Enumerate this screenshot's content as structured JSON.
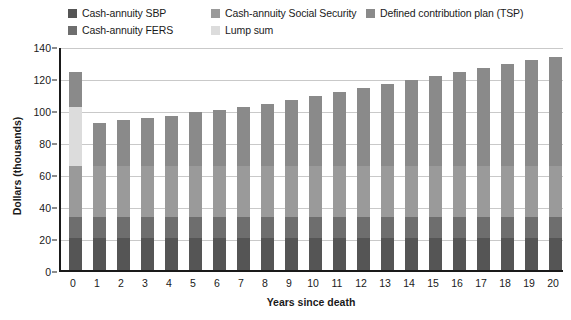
{
  "chart_data": {
    "type": "bar",
    "subtype": "stacked-column",
    "title": "",
    "xlabel": "Years since death",
    "ylabel": "Dollars (thousands)",
    "ylim": [
      0,
      140
    ],
    "ytick_step": 20,
    "yticks": [
      0,
      20,
      40,
      60,
      80,
      100,
      120,
      140
    ],
    "grid": true,
    "grid_axis": "y",
    "legend_position": "top",
    "categories": [
      "0",
      "1",
      "2",
      "3",
      "4",
      "5",
      "6",
      "7",
      "8",
      "9",
      "10",
      "11",
      "12",
      "13",
      "14",
      "15",
      "16",
      "17",
      "18",
      "19",
      "20"
    ],
    "x": [
      0,
      1,
      2,
      3,
      4,
      5,
      6,
      7,
      8,
      9,
      10,
      11,
      12,
      13,
      14,
      15,
      16,
      17,
      18,
      19,
      20
    ],
    "series": [
      {
        "name": "Cash-annuity SBP",
        "color": "#555555",
        "values": [
          20,
          20,
          20,
          20,
          20,
          20,
          20,
          20,
          20,
          20,
          20,
          20,
          20,
          20,
          20,
          20,
          20,
          20,
          20,
          20,
          20
        ]
      },
      {
        "name": "Cash-annuity FERS",
        "color": "#6e6e6e",
        "values": [
          13,
          13,
          13,
          13,
          13,
          13,
          13,
          13,
          13,
          13,
          13,
          13,
          13,
          13,
          13,
          13,
          13,
          13,
          13,
          13,
          13
        ]
      },
      {
        "name": "Cash-annuity Social Security",
        "color": "#9a9a9a",
        "values": [
          32,
          32,
          32,
          32,
          32,
          32,
          32,
          32,
          32,
          32,
          32,
          32,
          32,
          32,
          32,
          32,
          32,
          32,
          32,
          32,
          32
        ]
      },
      {
        "name": "Lump sum",
        "color": "#dcdcdc",
        "values": [
          37,
          0,
          0,
          0,
          0,
          0,
          0,
          0,
          0,
          0,
          0,
          0,
          0,
          0,
          0,
          0,
          0,
          0,
          0,
          0,
          0
        ]
      },
      {
        "name": "Defined contribution plan (TSP)",
        "color": "#8a8a8a",
        "values": [
          22,
          27,
          28.5,
          30,
          31.5,
          33.5,
          35,
          37,
          39,
          41.5,
          43.5,
          46,
          48.5,
          51.5,
          53.5,
          56,
          58.5,
          61,
          63.5,
          66,
          68
        ]
      }
    ],
    "totals": [
      124,
      92,
      93.5,
      95,
      96.5,
      98.5,
      100,
      102,
      104,
      106.5,
      108.5,
      111,
      113.5,
      116.5,
      118.5,
      121,
      123.5,
      126,
      128.5,
      131,
      133
    ]
  },
  "legend": {
    "columns": [
      {
        "items": [
          {
            "label": "Cash-annuity SBP",
            "color": "#555555"
          },
          {
            "label": "Cash-annuity FERS",
            "color": "#6e6e6e"
          }
        ]
      },
      {
        "items": [
          {
            "label": "Cash-annuity Social Security",
            "color": "#9a9a9a"
          },
          {
            "label": "Lump sum",
            "color": "#dcdcdc"
          }
        ]
      },
      {
        "items": [
          {
            "label": "Defined contribution plan (TSP)",
            "color": "#8a8a8a"
          }
        ]
      }
    ]
  },
  "axes": {
    "y_title": "Dollars (thousands)",
    "x_title": "Years since death"
  },
  "colors": {
    "axis": "#1a1a1a",
    "grid": "#c9c9c9",
    "background": "#ffffff"
  }
}
